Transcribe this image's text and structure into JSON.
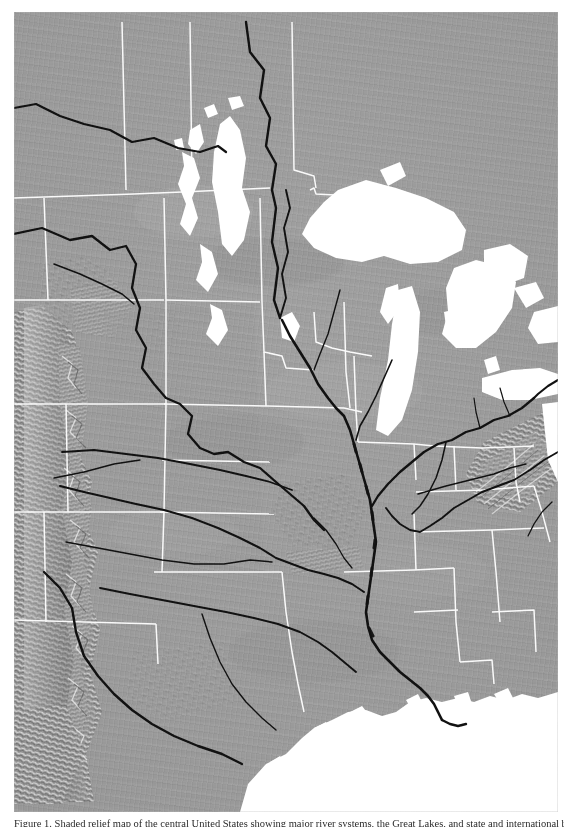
{
  "figure": {
    "kind": "shaded-relief-map",
    "title_visible": false,
    "caption": "Figure 1.  Shaded relief map of the central United States showing major river systems, the Great Lakes, and state and international boundaries.",
    "background_color": "#ffffff"
  },
  "map": {
    "region_name": "Central North America",
    "projection_hint": "conic",
    "colors": {
      "land_base": "#9a9a9a",
      "water": "#ffffff",
      "rivers": "#111111",
      "international_border": "#111111",
      "state_border": "#ffffff",
      "highlight": "#e8e8e8",
      "shadow": "#5e5e5e"
    },
    "legend_present": false,
    "scale_bar_present": false,
    "graticule_present": false,
    "water_bodies": [
      "Lake Superior",
      "Lake Michigan",
      "Lake Huron",
      "Lake Erie",
      "Lake Ontario",
      "Georgian Bay",
      "Lake Winnipeg",
      "Lake Manitoba",
      "Lake Winnipegosis",
      "Lake of the Woods",
      "Gulf of Mexico"
    ],
    "rivers": [
      "Mississippi River",
      "Missouri River",
      "Ohio River",
      "Arkansas River",
      "Red River",
      "Rio Grande",
      "Platte River",
      "Tennessee River",
      "Red River of the North",
      "Canadian River",
      "Wabash River",
      "Illinois River"
    ],
    "mountain_regions": [
      "Rocky Mountains",
      "Sangre de Cristo Range",
      "Ozark Plateau",
      "Ouachita Mountains",
      "Appalachian Mountains",
      "Black Hills"
    ],
    "boundaries": {
      "international": [
        "Canada - United States",
        "United States - Mexico"
      ],
      "state_lines_visible": true
    }
  }
}
